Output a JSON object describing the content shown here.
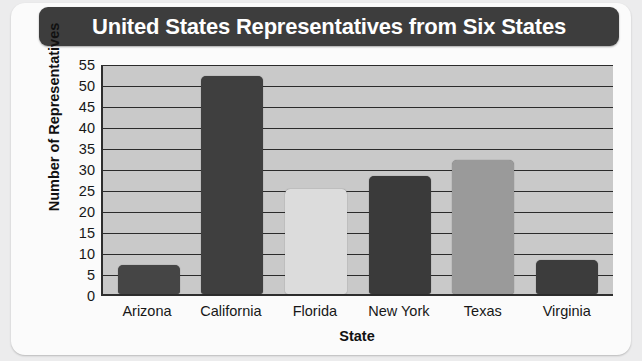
{
  "chart_data": {
    "type": "bar",
    "title": "United States Representatives from Six States",
    "xlabel": "State",
    "ylabel": "Number of Representatives",
    "categories": [
      "Arizona",
      "California",
      "Florida",
      "New York",
      "Texas",
      "Virginia"
    ],
    "values": [
      7,
      52,
      25,
      28,
      32,
      8
    ],
    "bar_colors": [
      "#454545",
      "#3f3f3f",
      "#dcdcdc",
      "#3a3a3a",
      "#9a9a9a",
      "#3c3c3c"
    ],
    "ylim": [
      0,
      55
    ],
    "ytick_step": 5,
    "yticks": [
      0,
      5,
      10,
      15,
      20,
      25,
      30,
      35,
      40,
      45,
      50,
      55
    ],
    "ytick_labels": [
      "0",
      "5",
      "10",
      "15",
      "20",
      "25",
      "30",
      "35",
      "40",
      "45",
      "50",
      "55"
    ],
    "grid": true,
    "grid_axis": "y",
    "legend": false,
    "plot_background": "#c9c9c9",
    "gridline_color": "#2b2b2b",
    "title_background": "#3d3d3d",
    "title_color": "#ffffff",
    "card_background": "#fbfbfb",
    "page_background": "#ececed"
  }
}
